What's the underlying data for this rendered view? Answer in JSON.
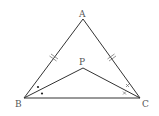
{
  "diagram": {
    "type": "geometry-triangle",
    "points": {
      "A": {
        "label": "A",
        "x": 83,
        "y": 19
      },
      "B": {
        "label": "B",
        "x": 24,
        "y": 98
      },
      "C": {
        "label": "C",
        "x": 140,
        "y": 98
      },
      "P": {
        "label": "P",
        "x": 83,
        "y": 68
      }
    },
    "segments": [
      "AB",
      "AC",
      "BC",
      "PB",
      "PC"
    ],
    "marks": {
      "equal_sides": [
        "AB",
        "AC"
      ],
      "equal_angles_at_B": [
        "ABP",
        "PBC"
      ],
      "equal_angles_at_C": [
        "ACP",
        "PCB"
      ],
      "angle_mark_B": "•",
      "angle_mark_C": "×"
    },
    "colors": {
      "stroke": "#333333",
      "label": "#555555",
      "background": "#ffffff"
    }
  }
}
